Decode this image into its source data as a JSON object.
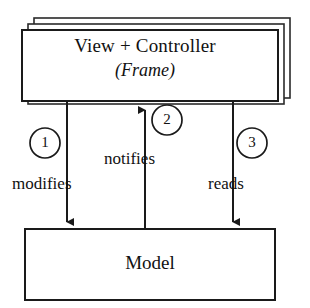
{
  "diagram": {
    "type": "flow-diagram",
    "background_color": "#ffffff",
    "stroke_color": "#1a1a1a"
  },
  "view_box": {
    "title": "View + Controller",
    "subtitle": "(Frame)",
    "stacked_copies": 3
  },
  "model_box": {
    "title": "Model"
  },
  "flows": [
    {
      "number": "1",
      "label": "modifies",
      "direction": "view-to-model"
    },
    {
      "number": "2",
      "label": "notifies",
      "direction": "model-to-view"
    },
    {
      "number": "3",
      "label": "reads",
      "direction": "view-to-model"
    }
  ]
}
